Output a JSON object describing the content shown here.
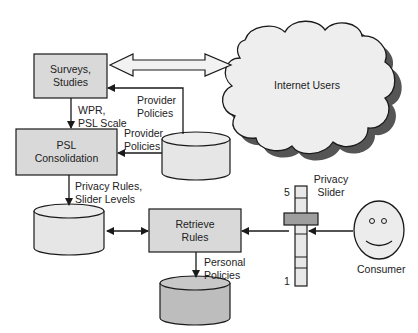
{
  "diagram": {
    "nodes": {
      "surveys": {
        "label": "Surveys,\nStudies"
      },
      "psl": {
        "label": "PSL\nConsolidation"
      },
      "retrieve": {
        "label": "Retrieve\nRules"
      },
      "internet_users": {
        "label": "Internet Users"
      },
      "consumer": {
        "label": "Consumer"
      },
      "slider": {
        "label": "Privacy\nSlider",
        "max_label": "5",
        "min_label": "1"
      }
    },
    "edges": {
      "wpr": {
        "label": "WPR,\nPSL Scale"
      },
      "provider_policies_1": {
        "label": "Provider\nPolicies"
      },
      "provider_policies_2": {
        "label": "Provider\nPolicies"
      },
      "privacy_rules": {
        "label": "Privacy Rules,\nSlider Levels"
      },
      "personal_policies": {
        "label": "Personal\nPolicies"
      }
    },
    "colors": {
      "box_fill": "#d9d9d9",
      "db_fill": "#e6e6e6",
      "db_dark_fill": "#bdbdbd",
      "cloud_fill": "#eeeeee",
      "cloud_shadow": "#555555",
      "stroke": "#1a1a1a"
    }
  }
}
